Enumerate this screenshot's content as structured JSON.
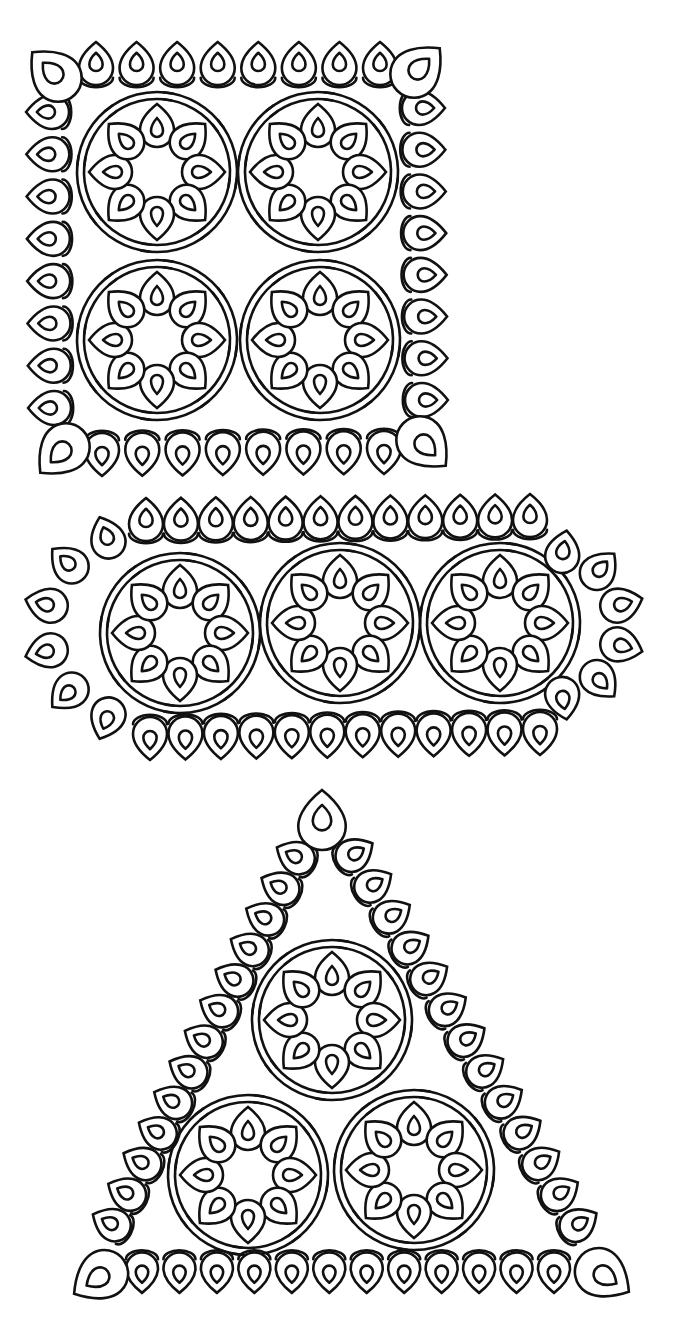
{
  "illustration": {
    "subject": "tatting lace motifs line art",
    "background": "#ffffff",
    "ink": "#111111",
    "pieces": [
      {
        "name": "square-doily",
        "shape": "square",
        "motifs": [
          {
            "cx": 157,
            "cy": 172
          },
          {
            "cx": 318,
            "cy": 172
          },
          {
            "cx": 157,
            "cy": 340
          },
          {
            "cx": 320,
            "cy": 340
          }
        ],
        "border": {
          "corners": [
            [
              50,
              70
            ],
            [
              422,
              66
            ],
            [
              58,
              455
            ],
            [
              428,
              448
            ]
          ],
          "top": {
            "from": [
              96,
              60
            ],
            "to": [
              380,
              60
            ],
            "count": 8
          },
          "bottom": {
            "from": [
              102,
              458
            ],
            "to": [
              384,
              456
            ],
            "count": 8
          },
          "left": {
            "from": [
              44,
              112
            ],
            "to": [
              46,
              408
            ],
            "count": 8
          },
          "right": {
            "from": [
              427,
              108
            ],
            "to": [
              430,
              400
            ],
            "count": 8
          }
        }
      },
      {
        "name": "oval-doily",
        "shape": "rounded-rectangle",
        "motifs": [
          {
            "cx": 180,
            "cy": 633
          },
          {
            "cx": 340,
            "cy": 623
          },
          {
            "cx": 500,
            "cy": 623
          }
        ],
        "border": {
          "top": {
            "from": [
              146,
              516
            ],
            "to": [
              530,
              512
            ],
            "count": 12
          },
          "bottom": {
            "from": [
              150,
              742
            ],
            "to": [
              540,
              737
            ],
            "count": 12
          },
          "left_arc": {
            "cx": 140,
            "cy": 628,
            "r": 100,
            "start": 110,
            "end": 250,
            "count": 6
          },
          "right_arc": {
            "cx": 550,
            "cy": 625,
            "r": 78,
            "start": -80,
            "end": 80,
            "count": 6
          }
        }
      },
      {
        "name": "triangle-doily",
        "shape": "triangle",
        "motifs": [
          {
            "cx": 332,
            "cy": 1020
          },
          {
            "cx": 248,
            "cy": 1175
          },
          {
            "cx": 414,
            "cy": 1170
          }
        ],
        "border": {
          "corners": [
            [
              322,
              815
            ],
            [
              95,
              1280
            ],
            [
              608,
              1278
            ]
          ],
          "left": {
            "from": [
              292,
              855
            ],
            "to": [
              108,
              1222
            ],
            "count": 13
          },
          "right": {
            "from": [
              358,
              852
            ],
            "to": [
              582,
              1222
            ],
            "count": 13
          },
          "bottom": {
            "from": [
              142,
              1276
            ],
            "to": [
              554,
              1276
            ],
            "count": 12
          }
        }
      }
    ]
  }
}
